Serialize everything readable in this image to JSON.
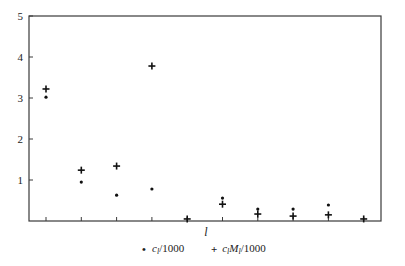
{
  "chart_data": {
    "type": "scatter",
    "title": "",
    "xlabel": "l",
    "ylabel": "",
    "xlim": [
      0.5,
      10.5
    ],
    "ylim": [
      0,
      5
    ],
    "y_ticks": [
      1,
      2,
      3,
      4,
      5
    ],
    "x_ticks": [
      1,
      2,
      3,
      4,
      5,
      6,
      7,
      8,
      9,
      10
    ],
    "x_tick_labels_shown": false,
    "grid": false,
    "legend_position": "bottom",
    "x": [
      1,
      2,
      3,
      4,
      5,
      6,
      7,
      8,
      9,
      10
    ],
    "series": [
      {
        "name": "c_l/1000",
        "marker": "dot",
        "values": [
          3.02,
          0.95,
          0.63,
          0.78,
          null,
          0.56,
          0.29,
          0.29,
          0.39,
          null
        ]
      },
      {
        "name": "c_l M_l/1000",
        "marker": "plus",
        "values": [
          3.22,
          1.24,
          1.34,
          3.78,
          0.05,
          0.41,
          0.17,
          0.12,
          0.15,
          0.05
        ]
      }
    ]
  },
  "legend": {
    "items": [
      {
        "marker": "•",
        "label_base": "c",
        "label_sub": "l",
        "label_rest": "/1000"
      },
      {
        "marker": "+",
        "label_base": "c",
        "label_sub": "l",
        "label_mid": "M",
        "label_sub2": "l",
        "label_rest": "/1000"
      }
    ]
  },
  "axis": {
    "xlabel": "l"
  }
}
